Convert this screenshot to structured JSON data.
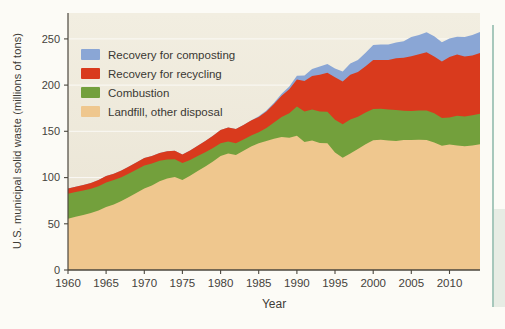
{
  "figure": {
    "ylabel": "U.S. municipal solid waste (millions of tons)",
    "xlabel": "Year",
    "background": "#FCFBF6",
    "plot_bg_top": "#F2EEE1",
    "plot_bg_bottom": "#E9E3D3",
    "axis_color": "#4B473E",
    "tick_text_color": "#45423B",
    "gridline_color": "rgba(255,255,255,0.75)"
  },
  "legend": {
    "items": [
      {
        "label": "Recovery for composting",
        "color": "#8AA6D5"
      },
      {
        "label": "Recovery for recycling",
        "color": "#D93A1D"
      },
      {
        "label": "Combustion",
        "color": "#73A03C"
      },
      {
        "label": "Landfill, other disposal",
        "color": "#EFC78E"
      }
    ]
  },
  "side_panel": {
    "border_color": "#92BCAE",
    "fill_color": "#E7ECE4"
  },
  "chart_data": {
    "type": "area",
    "stacked": true,
    "title": "",
    "xlabel": "Year",
    "ylabel": "U.S. municipal solid waste (millions of tons)",
    "xlim": [
      1960,
      2014
    ],
    "ylim": [
      0,
      278
    ],
    "x_ticks": [
      1960,
      1965,
      1970,
      1975,
      1980,
      1985,
      1990,
      1995,
      2000,
      2005,
      2010
    ],
    "y_ticks": [
      0,
      50,
      100,
      150,
      200,
      250
    ],
    "grid": "faint white horizontal lines at y ticks",
    "legend_position": "upper-left inside plot",
    "x": [
      1960,
      1961,
      1962,
      1963,
      1964,
      1965,
      1966,
      1967,
      1968,
      1969,
      1970,
      1971,
      1972,
      1973,
      1974,
      1975,
      1976,
      1977,
      1978,
      1979,
      1980,
      1981,
      1982,
      1983,
      1984,
      1985,
      1986,
      1987,
      1988,
      1989,
      1990,
      1991,
      1992,
      1993,
      1994,
      1995,
      1996,
      1997,
      1998,
      1999,
      2000,
      2001,
      2002,
      2003,
      2004,
      2005,
      2006,
      2007,
      2008,
      2009,
      2010,
      2011,
      2012,
      2013,
      2014
    ],
    "series": [
      {
        "name": "Landfill, other disposal",
        "color": "#EFC78E",
        "values": [
          55.5,
          57.5,
          59.5,
          61.5,
          64.5,
          68.0,
          71.0,
          74.5,
          79.0,
          83.5,
          88.0,
          91.5,
          96.0,
          99.0,
          100.5,
          97.5,
          102.0,
          107.0,
          112.0,
          117.5,
          123.4,
          126.0,
          124.5,
          129.0,
          133.5,
          137.2,
          139.5,
          142.0,
          144.0,
          143.0,
          145.3,
          138.5,
          140.0,
          137.5,
          137.0,
          127.0,
          121.5,
          126.0,
          131.0,
          136.0,
          140.3,
          141.0,
          140.0,
          139.5,
          140.5,
          140.5,
          141.0,
          140.5,
          138.0,
          134.5,
          135.7,
          134.7,
          133.8,
          134.7,
          136.0
        ]
      },
      {
        "name": "Combustion",
        "color": "#73A03C",
        "values": [
          27.0,
          26.8,
          26.6,
          26.4,
          26.2,
          26.8,
          26.2,
          25.8,
          25.4,
          25.2,
          25.1,
          23.6,
          22.1,
          20.6,
          19.4,
          18.2,
          17.1,
          16.2,
          15.3,
          14.5,
          13.7,
          13.1,
          12.6,
          12.2,
          11.9,
          11.7,
          14.0,
          17.5,
          21.5,
          26.5,
          31.7,
          33.0,
          33.6,
          33.8,
          34.1,
          35.5,
          36.1,
          36.7,
          34.8,
          34.3,
          33.7,
          33.4,
          33.5,
          33.7,
          31.8,
          31.6,
          31.4,
          32.0,
          31.6,
          29.8,
          29.3,
          32.2,
          32.4,
          32.7,
          33.1
        ]
      },
      {
        "name": "Recovery for recycling",
        "color": "#D93A1D",
        "values": [
          5.6,
          5.8,
          6.0,
          6.2,
          6.5,
          6.8,
          7.0,
          7.2,
          7.5,
          7.8,
          8.0,
          8.2,
          8.5,
          8.8,
          9.1,
          9.3,
          10.2,
          11.2,
          12.2,
          13.3,
          14.5,
          14.9,
          15.3,
          15.8,
          16.2,
          16.7,
          18.0,
          20.0,
          23.0,
          26.0,
          29.0,
          32.9,
          36.1,
          39.9,
          42.2,
          46.0,
          46.3,
          48.6,
          48.4,
          50.1,
          53.0,
          52.7,
          53.7,
          55.8,
          57.4,
          59.2,
          61.0,
          63.0,
          61.2,
          61.3,
          65.3,
          66.2,
          64.6,
          64.7,
          65.5
        ]
      },
      {
        "name": "Recovery for composting",
        "color": "#8AA6D5",
        "values": [
          0,
          0,
          0,
          0,
          0,
          0,
          0,
          0,
          0,
          0,
          0,
          0,
          0,
          0,
          0,
          0,
          0,
          0,
          0,
          0,
          0,
          0,
          0,
          0,
          0,
          0.7,
          1.0,
          1.5,
          2.1,
          3.0,
          4.2,
          6.0,
          7.8,
          9.0,
          9.4,
          9.6,
          10.8,
          12.1,
          13.1,
          14.7,
          16.5,
          16.9,
          16.7,
          17.1,
          17.7,
          20.6,
          20.8,
          21.7,
          22.1,
          20.8,
          20.2,
          19.3,
          21.3,
          22.0,
          23.0
        ]
      }
    ]
  }
}
